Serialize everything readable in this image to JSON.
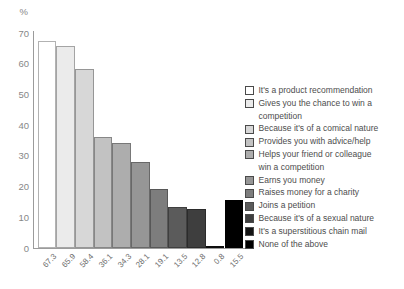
{
  "chart_data": {
    "type": "bar",
    "title": "",
    "ylabel": "%",
    "xlabel": "",
    "ylim": [
      0,
      70
    ],
    "yticks": [
      0,
      10,
      20,
      30,
      40,
      50,
      60,
      70
    ],
    "grid": false,
    "legend_position": "right",
    "categories": [
      "It's a product recommendation",
      "Gives you the chance to win a competition",
      "Because it's of a comical nature",
      "Provides you with advice/help",
      "Helps your friend or colleague win a competition",
      "Earns you money",
      "Raises money for a charity",
      "Joins a petition",
      "Because it's of a sexual nature",
      "It's a superstitious chain mail",
      "None of the above"
    ],
    "values": [
      67.3,
      65.9,
      58.4,
      36.1,
      34.3,
      28.1,
      19.1,
      13.5,
      12.8,
      0.8,
      15.5
    ],
    "bar_labels": [
      "67.3",
      "65.9",
      "58.4",
      "36.1",
      "34.3",
      "28.1",
      "19.1",
      "13.5",
      "12.8",
      "0.8",
      "15.5"
    ],
    "colors": [
      "#ffffff",
      "#ebebeb",
      "#d7d7d7",
      "#c2c2c2",
      "#adadad",
      "#969696",
      "#7d7d7d",
      "#5b5b5b",
      "#3e3e3e",
      "#141414",
      "#000000"
    ],
    "axis_color": "#9b9b9b",
    "tick_label_color": "#878787",
    "bar_label_color": "#6e6e6e",
    "legend_text_color": "#4d4d4d"
  }
}
